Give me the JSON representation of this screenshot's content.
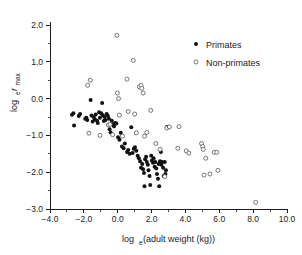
{
  "figure": {
    "background": "#ffffff",
    "foreground": "#1a1a1a"
  },
  "axes": {
    "x_title_main": "log",
    "x_title_sub": "e",
    "x_title_rest": " (adult weight (kg))",
    "x_title_full": "log_e (adult weight (kg))",
    "y_title_main": "log",
    "y_title_sub": "e",
    "y_title_rest": "r",
    "y_title_sub2": "max",
    "y_title_full": "log_e r_max"
  },
  "chart_data": {
    "type": "scatter",
    "title": "",
    "xlabel": "log_e (adult weight (kg))",
    "ylabel": "log_e r_max",
    "xlim": [
      -4.0,
      10.0
    ],
    "ylim": [
      -3.0,
      2.0
    ],
    "xticks": [
      -4.0,
      -2.0,
      0.0,
      2.0,
      4.0,
      6.0,
      8.0,
      10.0
    ],
    "xtick_labels": [
      "-4.0",
      "-2.0",
      "0.0",
      "2.0",
      "4.0",
      "6.0",
      "8.0",
      "10.0"
    ],
    "x_minor_step": 1.0,
    "yticks": [
      -3.0,
      -2.0,
      -1.0,
      0.0,
      1.0,
      2.0
    ],
    "ytick_labels": [
      "-3.0",
      "-2.0",
      "-1.0",
      "0.0",
      "1.0",
      "2.0"
    ],
    "y_minor_step": 0.5,
    "grid": false,
    "legend_position": "top-right",
    "marker_color_filled": "#111111",
    "marker_color_open": "#ffffff",
    "marker_edge_open": "#555555",
    "series": [
      {
        "name": "Primates",
        "marker": "filled-circle",
        "points": [
          [
            -2.7,
            -0.44
          ],
          [
            -2.62,
            -0.4
          ],
          [
            -2.58,
            -0.73
          ],
          [
            -2.3,
            -0.47
          ],
          [
            -2.22,
            -0.42
          ],
          [
            -1.92,
            -0.55
          ],
          [
            -1.85,
            -0.52
          ],
          [
            -1.8,
            -0.58
          ],
          [
            -1.6,
            -0.04
          ],
          [
            -1.55,
            -0.46
          ],
          [
            -1.48,
            -0.62
          ],
          [
            -1.42,
            -0.5
          ],
          [
            -1.35,
            -0.56
          ],
          [
            -1.3,
            -0.43
          ],
          [
            -1.22,
            -0.6
          ],
          [
            -1.18,
            -0.66
          ],
          [
            -1.1,
            -0.37
          ],
          [
            -1.05,
            -0.52
          ],
          [
            -0.98,
            -0.4
          ],
          [
            -0.92,
            -0.12
          ],
          [
            -0.88,
            -0.45
          ],
          [
            -0.82,
            -0.61
          ],
          [
            -0.78,
            -0.5
          ],
          [
            -0.72,
            -0.58
          ],
          [
            -0.65,
            -0.42
          ],
          [
            -0.58,
            -0.47
          ],
          [
            -0.52,
            -0.55
          ],
          [
            -0.48,
            -0.83
          ],
          [
            -0.42,
            -0.92
          ],
          [
            -0.35,
            -0.6
          ],
          [
            -0.28,
            -0.7
          ],
          [
            -0.22,
            -0.75
          ],
          [
            -0.15,
            -0.66
          ],
          [
            -0.08,
            -0.68
          ],
          [
            0.02,
            -1.05
          ],
          [
            0.1,
            -1.12
          ],
          [
            0.18,
            -0.93
          ],
          [
            0.25,
            -1.3
          ],
          [
            0.35,
            -1.35
          ],
          [
            0.42,
            -1.22
          ],
          [
            0.55,
            -1.45
          ],
          [
            0.62,
            -1.4
          ],
          [
            0.7,
            -1.5
          ],
          [
            0.8,
            -0.78
          ],
          [
            0.88,
            -1.48
          ],
          [
            0.95,
            -1.36
          ],
          [
            1.02,
            -1.32
          ],
          [
            1.1,
            -1.42
          ],
          [
            1.18,
            -1.55
          ],
          [
            1.25,
            -1.62
          ],
          [
            1.32,
            -1.7
          ],
          [
            1.38,
            -1.88
          ],
          [
            1.45,
            -1.78
          ],
          [
            1.5,
            -1.92
          ],
          [
            1.55,
            -2.02
          ],
          [
            1.58,
            -2.38
          ],
          [
            1.62,
            -1.65
          ],
          [
            1.68,
            -1.58
          ],
          [
            1.72,
            -1.72
          ],
          [
            1.78,
            -1.8
          ],
          [
            1.82,
            -1.95
          ],
          [
            1.88,
            -2.1
          ],
          [
            1.92,
            -2.35
          ],
          [
            1.98,
            -1.55
          ],
          [
            2.02,
            -1.68
          ],
          [
            2.08,
            -1.74
          ],
          [
            2.12,
            -1.62
          ],
          [
            2.18,
            -1.85
          ],
          [
            2.22,
            -1.72
          ],
          [
            2.28,
            -1.9
          ],
          [
            2.32,
            -2.05
          ],
          [
            2.38,
            -2.18
          ],
          [
            2.42,
            -1.78
          ],
          [
            2.45,
            -2.38
          ],
          [
            2.5,
            -1.7
          ],
          [
            2.55,
            -1.45
          ],
          [
            2.58,
            -1.8
          ],
          [
            2.62,
            -1.72
          ],
          [
            2.68,
            -1.88
          ],
          [
            2.72,
            -2.1
          ],
          [
            2.78,
            -1.72
          ],
          [
            2.82,
            -2.05
          ],
          [
            2.85,
            -1.95
          ],
          [
            2.92,
            -0.77
          ]
        ]
      },
      {
        "name": "Non-primates",
        "marker": "open-circle",
        "points": [
          [
            -1.62,
            0.5
          ],
          [
            -1.78,
            0.36
          ],
          [
            -1.7,
            -0.94
          ],
          [
            -1.05,
            -1.0
          ],
          [
            -0.55,
            -0.72
          ],
          [
            -0.45,
            -0.7
          ],
          [
            -0.3,
            -0.98
          ],
          [
            -0.05,
            1.72
          ],
          [
            -0.02,
            0.15
          ],
          [
            0.05,
            0.0
          ],
          [
            0.1,
            -0.45
          ],
          [
            0.28,
            -1.02
          ],
          [
            0.55,
            0.53
          ],
          [
            0.62,
            -0.35
          ],
          [
            0.92,
            1.04
          ],
          [
            1.0,
            -0.42
          ],
          [
            1.1,
            -0.93
          ],
          [
            1.28,
            0.32
          ],
          [
            1.38,
            0.36
          ],
          [
            1.42,
            0.28
          ],
          [
            1.5,
            0.15
          ],
          [
            1.58,
            -1.02
          ],
          [
            1.72,
            -0.92
          ],
          [
            1.95,
            -0.32
          ],
          [
            2.25,
            -1.22
          ],
          [
            2.5,
            -1.38
          ],
          [
            2.78,
            -2.12
          ],
          [
            2.9,
            -0.8
          ],
          [
            3.05,
            -0.77
          ],
          [
            3.55,
            -1.35
          ],
          [
            3.62,
            -0.76
          ],
          [
            4.05,
            -1.42
          ],
          [
            4.2,
            -1.48
          ],
          [
            4.95,
            -1.22
          ],
          [
            5.02,
            -1.3
          ],
          [
            5.05,
            -1.38
          ],
          [
            5.1,
            -2.08
          ],
          [
            5.2,
            -1.62
          ],
          [
            5.45,
            -2.05
          ],
          [
            5.7,
            -1.46
          ],
          [
            5.85,
            -1.46
          ],
          [
            5.92,
            -1.95
          ],
          [
            8.15,
            -2.82
          ]
        ]
      }
    ]
  },
  "legend": {
    "items": [
      {
        "label": "Primates",
        "marker": "filled-circle"
      },
      {
        "label": "Non-primates",
        "marker": "open-circle"
      }
    ]
  }
}
